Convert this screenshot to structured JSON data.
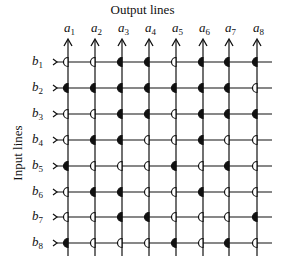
{
  "diagram": {
    "title": "Output lines",
    "side_title": "Input lines",
    "output_lines": [
      "a1",
      "a2",
      "a3",
      "a4",
      "a5",
      "a6",
      "a7",
      "a8"
    ],
    "input_lines": [
      "b1",
      "b2",
      "b3",
      "b4",
      "b5",
      "b6",
      "b7",
      "b8"
    ],
    "legend": {
      "filled": "filled half-circle contact",
      "open": "open half-circle contact"
    },
    "matrix": [
      [
        0,
        0,
        1,
        1,
        0,
        1,
        1,
        1
      ],
      [
        1,
        1,
        1,
        1,
        1,
        1,
        1,
        0
      ],
      [
        0,
        0,
        1,
        1,
        0,
        1,
        1,
        1
      ],
      [
        0,
        1,
        1,
        0,
        0,
        1,
        0,
        0
      ],
      [
        1,
        0,
        0,
        0,
        1,
        0,
        1,
        0
      ],
      [
        0,
        1,
        1,
        0,
        0,
        1,
        0,
        0
      ],
      [
        0,
        0,
        1,
        1,
        0,
        0,
        0,
        1
      ],
      [
        1,
        0,
        0,
        0,
        1,
        0,
        1,
        0
      ]
    ],
    "colors": {
      "line": "#111111",
      "background": "#ffffff"
    }
  }
}
